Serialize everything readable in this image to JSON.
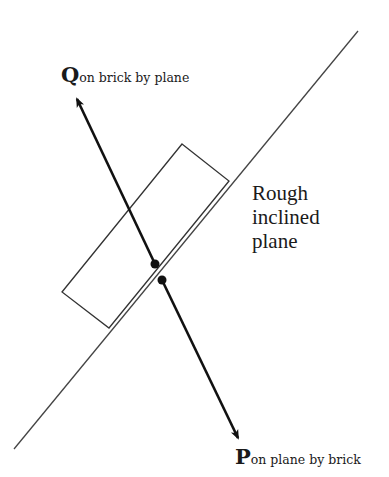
{
  "diagram": {
    "plane_label_lines": [
      "Rough",
      "inclined",
      "plane"
    ],
    "force_q": {
      "symbol": "Q",
      "subscript": "on brick by plane"
    },
    "force_p": {
      "symbol": "P",
      "subscript": "on plane by brick"
    },
    "colors": {
      "ink": "#1a1a1a",
      "plane_line": "#444444",
      "background": "#ffffff"
    }
  }
}
